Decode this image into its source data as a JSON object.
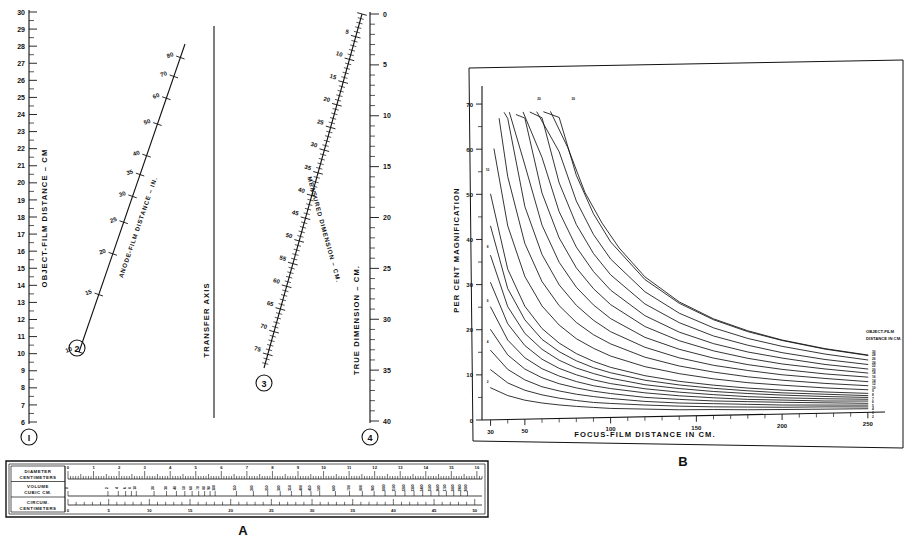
{
  "figure": {
    "panel_a_label": "A",
    "panel_b_label": "B",
    "transfer_axis_label": "TRANSFER AXIS"
  },
  "nomogram": {
    "scales": [
      {
        "id": "1",
        "marker": "I",
        "label": "OBJECT-FILM DISTANCE – CM",
        "min": 6,
        "max": 30,
        "ticks": [
          30,
          29,
          28,
          27,
          26,
          25,
          24,
          23,
          22,
          21,
          20,
          19,
          18,
          17,
          16,
          15,
          14,
          13,
          12,
          11,
          10,
          9,
          8,
          7,
          6
        ]
      },
      {
        "id": "2",
        "marker": "2",
        "label": "ANODE-FILM DISTANCE – IN.",
        "ticks": [
          80,
          70,
          60,
          50,
          40,
          35,
          30,
          25,
          20,
          15,
          10
        ]
      },
      {
        "id": "3",
        "marker": "3",
        "label": "MEASURED DIMENSION – CM.",
        "ticks": [
          5,
          10,
          15,
          20,
          25,
          30,
          35,
          40,
          45,
          50,
          55,
          60,
          65,
          70,
          75
        ]
      },
      {
        "id": "4",
        "marker": "4",
        "label": "TRUE DIMENSION – CM.",
        "min": 0,
        "max": 40,
        "ticks": [
          0,
          5,
          10,
          15,
          20,
          25,
          30,
          35,
          40
        ]
      }
    ]
  },
  "chart_data": {
    "type": "line",
    "title": "",
    "xlabel": "FOCUS-FILM DISTANCE IN CM.",
    "ylabel": "PER CENT MAGNIFICATION",
    "xlim": [
      25,
      260
    ],
    "ylim": [
      0,
      74
    ],
    "xticks": [
      30,
      50,
      100,
      150,
      200,
      250
    ],
    "yticks": [
      0,
      10,
      20,
      30,
      40,
      50,
      60,
      70
    ],
    "grid": false,
    "legend_position": "right-inside",
    "series_label": "OBJECT-FILM DISTANCE IN CM.",
    "curve_end_labels": [
      "30",
      "28",
      "26",
      "24",
      "22",
      "20",
      "18",
      "16",
      "14",
      "12",
      "10",
      "9",
      "8",
      "7",
      "6",
      "5",
      "4",
      "3",
      "2"
    ],
    "annotated_curves": [
      {
        "name": "2",
        "label_x": 30,
        "label_y": 7.5
      },
      {
        "name": "4",
        "label_x": 30,
        "label_y": 16.5
      },
      {
        "name": "6",
        "label_x": 30,
        "label_y": 25.5
      },
      {
        "name": "8",
        "label_x": 30,
        "label_y": 37.5
      },
      {
        "name": "10",
        "label_x": 30,
        "label_y": 54.5
      },
      {
        "name": "20",
        "label_x": 60,
        "label_y": 70
      },
      {
        "name": "30",
        "label_x": 80,
        "label_y": 70
      }
    ],
    "series": [
      {
        "name": "2",
        "object_film_cm": 2,
        "x": [
          30,
          40,
          50,
          60,
          70,
          80,
          90,
          100,
          120,
          140,
          160,
          180,
          200,
          225,
          250
        ],
        "values": [
          7.1,
          5.3,
          4.2,
          3.5,
          3.0,
          2.6,
          2.3,
          2.0,
          1.7,
          1.4,
          1.3,
          1.1,
          1.0,
          0.9,
          0.8
        ]
      },
      {
        "name": "3",
        "object_film_cm": 3,
        "x": [
          30,
          40,
          50,
          60,
          70,
          80,
          90,
          100,
          120,
          140,
          160,
          180,
          200,
          225,
          250
        ],
        "values": [
          11.1,
          8.1,
          6.4,
          5.3,
          4.5,
          3.9,
          3.4,
          3.1,
          2.6,
          2.2,
          1.9,
          1.7,
          1.5,
          1.4,
          1.2
        ]
      },
      {
        "name": "4",
        "object_film_cm": 4,
        "x": [
          30,
          40,
          50,
          60,
          70,
          80,
          90,
          100,
          120,
          140,
          160,
          180,
          200,
          225,
          250
        ],
        "values": [
          15.4,
          11.1,
          8.7,
          7.1,
          6.1,
          5.3,
          4.7,
          4.2,
          3.4,
          2.9,
          2.6,
          2.3,
          2.0,
          1.8,
          1.6
        ]
      },
      {
        "name": "5",
        "object_film_cm": 5,
        "x": [
          30,
          40,
          50,
          60,
          70,
          80,
          90,
          100,
          120,
          140,
          160,
          180,
          200,
          225,
          250
        ],
        "values": [
          20.0,
          14.3,
          11.1,
          9.1,
          7.7,
          6.7,
          5.9,
          5.3,
          4.3,
          3.7,
          3.2,
          2.9,
          2.6,
          2.3,
          2.0
        ]
      },
      {
        "name": "6",
        "object_film_cm": 6,
        "x": [
          30,
          40,
          50,
          60,
          70,
          80,
          90,
          100,
          120,
          140,
          160,
          180,
          200,
          225,
          250
        ],
        "values": [
          25.0,
          17.6,
          13.6,
          11.1,
          9.4,
          8.1,
          7.1,
          6.4,
          5.3,
          4.5,
          3.9,
          3.4,
          3.1,
          2.7,
          2.5
        ]
      },
      {
        "name": "7",
        "object_film_cm": 7,
        "x": [
          30,
          40,
          50,
          60,
          70,
          80,
          90,
          100,
          120,
          140,
          160,
          180,
          200,
          225,
          250
        ],
        "values": [
          30.4,
          21.2,
          16.3,
          13.2,
          11.1,
          9.6,
          8.4,
          7.5,
          6.2,
          5.3,
          4.6,
          4.0,
          3.6,
          3.2,
          2.9
        ]
      },
      {
        "name": "8",
        "object_film_cm": 8,
        "x": [
          30,
          40,
          50,
          60,
          70,
          80,
          90,
          100,
          120,
          140,
          160,
          180,
          200,
          225,
          250
        ],
        "values": [
          36.4,
          25.0,
          19.0,
          15.4,
          12.9,
          11.1,
          9.8,
          8.7,
          7.1,
          6.1,
          5.3,
          4.7,
          4.2,
          3.7,
          3.3
        ]
      },
      {
        "name": "9",
        "object_film_cm": 9,
        "x": [
          30,
          40,
          50,
          60,
          70,
          80,
          90,
          100,
          120,
          140,
          160,
          180,
          200,
          225,
          250
        ],
        "values": [
          42.9,
          29.0,
          22.0,
          17.6,
          14.8,
          12.7,
          11.1,
          9.9,
          8.1,
          6.9,
          6.0,
          5.3,
          4.7,
          4.2,
          3.7
        ]
      },
      {
        "name": "10",
        "object_film_cm": 10,
        "x": [
          30,
          40,
          50,
          60,
          70,
          80,
          90,
          100,
          120,
          140,
          160,
          180,
          200,
          225,
          250
        ],
        "values": [
          50.0,
          33.3,
          25.0,
          20.0,
          16.7,
          14.3,
          12.5,
          11.1,
          9.1,
          7.7,
          6.7,
          5.9,
          5.3,
          4.7,
          4.2
        ]
      },
      {
        "name": "12",
        "object_film_cm": 12,
        "x": [
          32,
          40,
          50,
          60,
          70,
          80,
          90,
          100,
          120,
          140,
          160,
          180,
          200,
          225,
          250
        ],
        "values": [
          60.0,
          42.9,
          31.6,
          25.0,
          20.7,
          17.6,
          15.4,
          13.6,
          11.1,
          9.4,
          8.1,
          7.1,
          6.4,
          5.6,
          5.0
        ]
      },
      {
        "name": "14",
        "object_film_cm": 14,
        "x": [
          35,
          40,
          50,
          60,
          70,
          80,
          90,
          100,
          120,
          140,
          160,
          180,
          200,
          225,
          250
        ],
        "values": [
          66.7,
          53.8,
          38.9,
          30.4,
          25.0,
          21.2,
          18.4,
          16.3,
          13.2,
          11.1,
          9.6,
          8.4,
          7.5,
          6.6,
          5.9
        ]
      },
      {
        "name": "16",
        "object_film_cm": 16,
        "x": [
          38,
          40,
          50,
          60,
          70,
          80,
          90,
          100,
          120,
          140,
          160,
          180,
          200,
          225,
          250
        ],
        "values": [
          68.0,
          66.7,
          47.1,
          36.4,
          29.6,
          25.0,
          21.6,
          19.0,
          15.4,
          12.9,
          11.1,
          9.8,
          8.7,
          7.7,
          6.8
        ]
      },
      {
        "name": "18",
        "object_film_cm": 18,
        "x": [
          41,
          50,
          60,
          70,
          80,
          90,
          100,
          120,
          140,
          160,
          180,
          200,
          225,
          250
        ],
        "values": [
          68.0,
          56.3,
          42.9,
          34.6,
          29.0,
          25.0,
          21.9,
          17.6,
          14.8,
          12.7,
          11.1,
          9.9,
          8.7,
          7.8
        ]
      },
      {
        "name": "20",
        "object_film_cm": 20,
        "x": [
          45,
          50,
          60,
          70,
          80,
          90,
          100,
          120,
          140,
          160,
          180,
          200,
          225,
          250
        ],
        "values": [
          67.5,
          66.7,
          50.0,
          40.0,
          33.3,
          28.6,
          25.0,
          20.0,
          16.7,
          14.3,
          12.5,
          11.1,
          9.8,
          8.7
        ]
      },
      {
        "name": "22",
        "object_film_cm": 22,
        "x": [
          49,
          60,
          70,
          80,
          90,
          100,
          120,
          140,
          160,
          180,
          200,
          225,
          250
        ],
        "values": [
          68.0,
          57.9,
          45.8,
          37.9,
          32.4,
          28.2,
          22.4,
          18.6,
          15.9,
          13.9,
          12.4,
          10.8,
          9.6
        ]
      },
      {
        "name": "24",
        "object_film_cm": 24,
        "x": [
          53,
          60,
          70,
          80,
          90,
          100,
          120,
          140,
          160,
          180,
          200,
          225,
          250
        ],
        "values": [
          68.0,
          66.7,
          52.2,
          42.9,
          36.4,
          31.6,
          25.0,
          20.7,
          17.6,
          15.4,
          13.6,
          11.9,
          10.6
        ]
      },
      {
        "name": "26",
        "object_film_cm": 26,
        "x": [
          57,
          70,
          80,
          90,
          100,
          120,
          140,
          160,
          180,
          200,
          225,
          250
        ],
        "values": [
          68.0,
          59.1,
          48.1,
          40.6,
          35.1,
          27.7,
          22.8,
          19.4,
          16.9,
          15.0,
          13.1,
          11.6
        ]
      },
      {
        "name": "28",
        "object_film_cm": 28,
        "x": [
          61,
          70,
          80,
          90,
          100,
          120,
          140,
          160,
          180,
          200,
          225,
          250
        ],
        "values": [
          68.0,
          66.7,
          53.8,
          45.2,
          38.9,
          30.4,
          25.0,
          21.2,
          18.4,
          16.3,
          14.2,
          12.6
        ]
      },
      {
        "name": "30",
        "object_film_cm": 30,
        "x": [
          65,
          75,
          85,
          95,
          105,
          120,
          140,
          160,
          180,
          200,
          225,
          250
        ],
        "values": [
          68.0,
          60.0,
          50.0,
          43.1,
          37.5,
          31.0,
          25.3,
          21.4,
          18.6,
          16.4,
          14.3,
          12.7
        ]
      }
    ]
  },
  "ruler": {
    "rows": [
      {
        "id": "diameter",
        "label_line1": "DIAMETER",
        "label_line2": "CENTIMETERS",
        "ticks": [
          0,
          1,
          2,
          3,
          4,
          5,
          6,
          7,
          8,
          9,
          10,
          11,
          12,
          13,
          14,
          15,
          16
        ]
      },
      {
        "id": "volume",
        "label_line1": "VOLUME",
        "label_line2": "CUBIC CM.",
        "ticks": [
          0,
          2,
          4,
          6,
          8,
          10,
          20,
          30,
          40,
          50,
          60,
          70,
          80,
          90,
          100,
          150,
          200,
          250,
          300,
          350,
          400,
          450,
          500,
          600,
          700,
          800,
          900,
          1000,
          1100,
          1200,
          1300,
          1400,
          1500,
          1600,
          1700,
          1800,
          1900,
          2000
        ]
      },
      {
        "id": "circumference",
        "label_line1": "CIRCUM.",
        "label_line2": "CENTIMETERS",
        "ticks": [
          0,
          5,
          10,
          15,
          20,
          25,
          30,
          35,
          40,
          45,
          50
        ]
      }
    ]
  }
}
